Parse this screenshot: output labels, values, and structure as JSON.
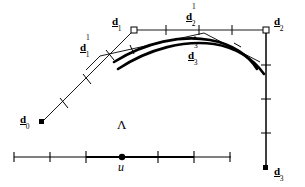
{
  "figure": {
    "background_color": "#ffffff",
    "ink_color": "#000000",
    "width": 305,
    "height": 187,
    "labels": {
      "d0": {
        "base": "d",
        "sub": "0",
        "sup": "",
        "x": 20,
        "y": 110
      },
      "d1": {
        "base": "d",
        "sub": "1",
        "sup": "",
        "x": 112,
        "y": 12
      },
      "d2": {
        "base": "d",
        "sub": "2",
        "sup": "",
        "x": 274,
        "y": 12
      },
      "d3": {
        "base": "d",
        "sub": "3",
        "sup": "",
        "x": 274,
        "y": 162
      },
      "d1_1": {
        "base": "d",
        "sub": "1",
        "sup": "1",
        "x": 80,
        "y": 38
      },
      "d2_1": {
        "base": "d",
        "sub": "2",
        "sup": "1",
        "x": 186,
        "y": 7
      },
      "d3_3": {
        "base": "d",
        "sub": "3",
        "sup": "3",
        "x": 188,
        "y": 46
      },
      "lambda": {
        "text": "Λ",
        "x": 117,
        "y": 118
      },
      "u": {
        "text": "u",
        "x": 118,
        "y": 160
      }
    },
    "points": {
      "d0": {
        "x": 42,
        "y": 122,
        "marker": "filled-square"
      },
      "d1": {
        "x": 134,
        "y": 30,
        "marker": "open-square"
      },
      "d2": {
        "x": 266,
        "y": 30,
        "marker": "open-square"
      },
      "d3": {
        "x": 266,
        "y": 168,
        "marker": "filled-square"
      },
      "u_dot": {
        "x": 122,
        "y": 157,
        "marker": "filled-dot"
      }
    },
    "control_polygon": {
      "description": "thin polyline d0 -> d1 -> d2 -> d3",
      "vertices": [
        [
          42,
          122
        ],
        [
          134,
          30
        ],
        [
          266,
          30
        ],
        [
          266,
          168
        ]
      ],
      "tick_marks_per_leg": 3
    },
    "first_subdivision_polygon": {
      "description": "thin polyline d1^1 -> d2^1 -> (descending to right)",
      "vertices": [
        [
          100,
          56
        ],
        [
          204,
          33
        ],
        [
          260,
          62
        ]
      ]
    },
    "bezier_curves": [
      {
        "name": "curve-outer",
        "style": "thick",
        "path": "M 118,69 C 150,48 185,40 214,44 C 238,48 254,60 264,74"
      },
      {
        "name": "curve-inner",
        "style": "thick",
        "path": "M 116,64 C 148,44 182,36 211,41 C 234,45 250,57 258,70"
      }
    ],
    "parameter_axis": {
      "y": 157,
      "x_start": 14,
      "x_end": 231,
      "tick_positions": [
        14,
        50,
        86,
        122,
        158,
        194,
        230
      ],
      "highlight_from": 86,
      "highlight_to": 194,
      "marked_value_x": 122
    }
  }
}
